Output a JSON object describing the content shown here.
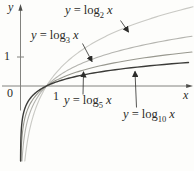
{
  "chart_data": {
    "type": "line",
    "title": "",
    "xlabel": "x",
    "ylabel": "y",
    "x_range": [
      0,
      6.7
    ],
    "y_range": [
      -2.6,
      2.9
    ],
    "grid": false,
    "legend_position": "inline-arrow-annotations",
    "common_point": [
      1,
      0
    ],
    "origin_label": "0",
    "x_tick_labels": [
      "1"
    ],
    "y_tick_labels": [
      "1"
    ],
    "axis_color": "#82827e",
    "axis_head_color": "#4d4d4a",
    "annotation_color": "#2c2c2a",
    "text_color": "#2b2b28",
    "series": [
      {
        "name": "y = log2 x",
        "function": "logarithm base 2",
        "base": 2,
        "color": "#c9c9c4",
        "label": {
          "var": "y",
          "eq": " = log",
          "sub": "2",
          "arg": "x"
        }
      },
      {
        "name": "y = log3 x",
        "function": "logarithm base 3",
        "base": 3,
        "color": "#b4b4af",
        "label": {
          "var": "y",
          "eq": " = log",
          "sub": "3",
          "arg": "x"
        }
      },
      {
        "name": "y = log5 x",
        "function": "logarithm base 5",
        "base": 5,
        "color": "#98988f",
        "label": {
          "var": "y",
          "eq": " = log",
          "sub": "5",
          "arg": "x"
        }
      },
      {
        "name": "y = log10 x",
        "function": "logarithm base 10",
        "base": 10,
        "color": "#3b3b38",
        "label": {
          "var": "y",
          "eq": " = log",
          "sub": "10",
          "arg": "x"
        }
      }
    ]
  }
}
